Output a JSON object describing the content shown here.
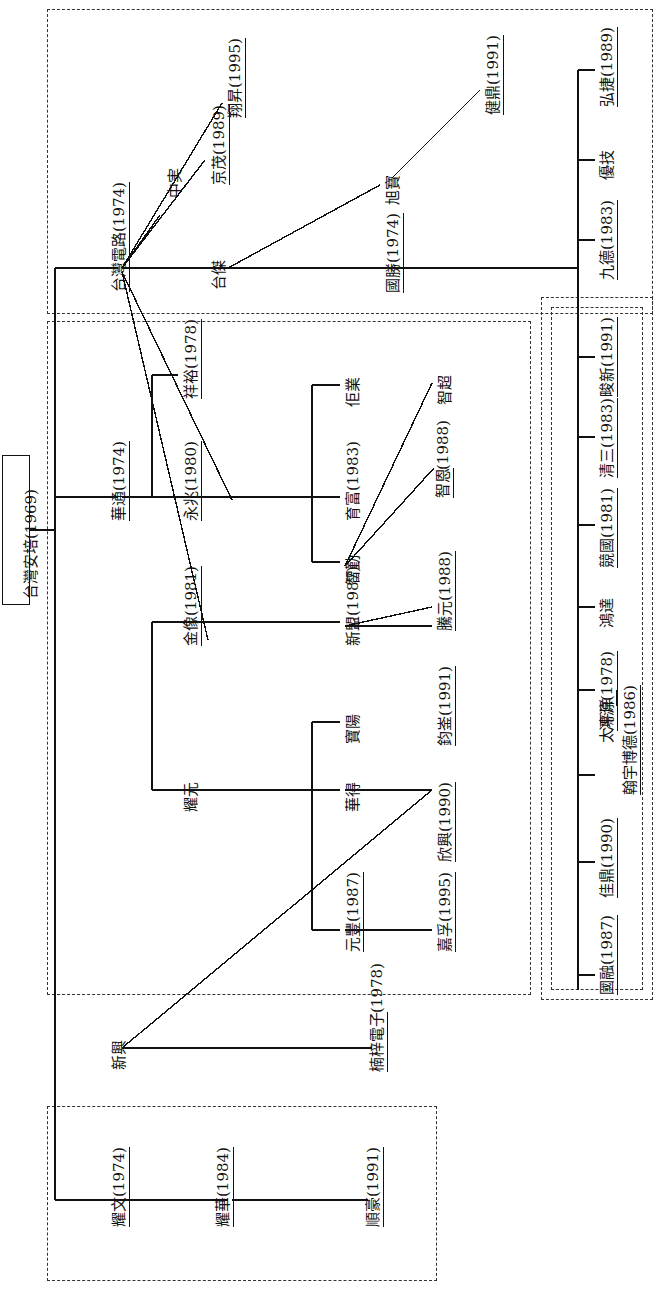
{
  "diagram": {
    "type": "organization-genealogy-tree",
    "orientation": "rotated-90-ccw",
    "root": {
      "label": "台灣安培 (1969)",
      "name": "台灣安培",
      "year": "1969"
    },
    "groups": [
      {
        "id": "group-taiwan-circuit",
        "style": "dashed"
      },
      {
        "id": "group-huatong",
        "style": "dashed"
      },
      {
        "id": "group-yaowen",
        "style": "dashed"
      },
      {
        "id": "group-right-outer",
        "style": "dashed"
      },
      {
        "id": "group-right-inner",
        "style": "dashed"
      }
    ],
    "nodes": [
      {
        "id": "n-taiwan-ampere",
        "label": "台灣安培 (1969)"
      },
      {
        "id": "n-taiwan-circuit",
        "label": "台灣電路 (1974)"
      },
      {
        "id": "n-xiangsheng",
        "label": "翔昇 (1995)"
      },
      {
        "id": "n-zhongshi",
        "label": "中実"
      },
      {
        "id": "n-jingmao",
        "label": "京茂 (1989)"
      },
      {
        "id": "n-taijie",
        "label": "台傑"
      },
      {
        "id": "n-jianding",
        "label": "健鼎 (1991)"
      },
      {
        "id": "n-xubao",
        "label": "旭寶"
      },
      {
        "id": "n-guosheng",
        "label": "國勝 (1974)"
      },
      {
        "id": "n-hongjie",
        "label": "弘捷 (1989)"
      },
      {
        "id": "n-youji",
        "label": "優技"
      },
      {
        "id": "n-jiude",
        "label": "九德 (1983)"
      },
      {
        "id": "n-junxin",
        "label": "畯新 (1991)"
      },
      {
        "id": "n-qingsan",
        "label": "清三 (1983)"
      },
      {
        "id": "n-jingguo",
        "label": "競國 (1981)"
      },
      {
        "id": "n-hongda",
        "label": "鴻達"
      },
      {
        "id": "n-hongyuan",
        "label": "鴻源 (1978)"
      },
      {
        "id": "n-taipingyang",
        "label": "太平洋"
      },
      {
        "id": "n-jiading",
        "label": "佳鼎 (1990)"
      },
      {
        "id": "n-guorong",
        "label": "國融 (1987)"
      },
      {
        "id": "n-hanyubode",
        "label": "翰宇博德 (1986)"
      },
      {
        "id": "n-huatong",
        "label": "華通 (1974)"
      },
      {
        "id": "n-xiangyu",
        "label": "祥裕 (1978)"
      },
      {
        "id": "n-yongzhao",
        "label": "永兆 (1980)"
      },
      {
        "id": "n-jinxiang",
        "label": "金像 (1981)"
      },
      {
        "id": "n-yaoyuan",
        "label": "耀元"
      },
      {
        "id": "n-quanye",
        "label": "佢業"
      },
      {
        "id": "n-yufu",
        "label": "育富 (1983)"
      },
      {
        "id": "n-zhiqin",
        "label": "智勤"
      },
      {
        "id": "n-zhichao",
        "label": "智超"
      },
      {
        "id": "n-zhien",
        "label": "智恩 (1988)"
      },
      {
        "id": "n-xinmeng",
        "label": "新盟 (1987)"
      },
      {
        "id": "n-tengyuan",
        "label": "騰元 (1988)"
      },
      {
        "id": "n-junpu",
        "label": "鈞崟 (1991)"
      },
      {
        "id": "n-baoyang",
        "label": "寶陽"
      },
      {
        "id": "n-huade",
        "label": "華得"
      },
      {
        "id": "n-xinxing1990",
        "label": "欣興 (1990)"
      },
      {
        "id": "n-yuanfeng",
        "label": "元豐 (1987)"
      },
      {
        "id": "n-jiafu",
        "label": "嘉孚 (1995)"
      },
      {
        "id": "n-xinxing",
        "label": "新興"
      },
      {
        "id": "n-nanzidianzi",
        "label": "楠梓電子 (1978)"
      },
      {
        "id": "n-yaowen",
        "label": "耀文 (1974)"
      },
      {
        "id": "n-yaohua",
        "label": "耀華 (1984)"
      },
      {
        "id": "n-shunhao",
        "label": "順豪 (1991)"
      }
    ],
    "labels": {
      "taiwan_ampere_name": "台灣安培",
      "taiwan_ampere_year": "(1969)",
      "taiwan_circuit_name": "台灣電路",
      "taiwan_circuit_year": "(1974)",
      "xiangsheng_name": "翔昇",
      "xiangsheng_year": "(1995)",
      "zhongshi_name": "中実",
      "jingmao_name": "京茂",
      "jingmao_year": "(1989)",
      "taijie_name": "台傑",
      "jianding_name": "健鼎",
      "jianding_year": "(1991)",
      "xubao_name": "旭寶",
      "guosheng_name": "國勝",
      "guosheng_year": "(1974)",
      "hongjie_name": "弘捷",
      "hongjie_year": "(1989)",
      "youji_name": "優技",
      "jiude_name": "九德",
      "jiude_year": "(1983)",
      "junxin_name": "畯新",
      "junxin_year": "(1991)",
      "qingsan_name": "清三",
      "qingsan_year": "(1983)",
      "jingguo_name": "競國",
      "jingguo_year": "(1981)",
      "hongda_name": "鴻達",
      "hongyuan_name": "鴻源",
      "hongyuan_year": "(1978)",
      "taipingyang_name": "太平洋",
      "jiading_name": "佳鼎",
      "jiading_year": "(1990)",
      "guorong_name": "國融",
      "guorong_year": "(1987)",
      "hanyubode_name": "翰宇博德",
      "hanyubode_year": "(1986)",
      "huatong_name": "華通",
      "huatong_year": "(1974)",
      "xiangyu_name": "祥裕",
      "xiangyu_year": "(1978)",
      "yongzhao_name": "永兆",
      "yongzhao_year": "(1980)",
      "jinxiang_name": "金像",
      "jinxiang_year": "(1981)",
      "yaoyuan_name": "耀元",
      "quanye_name": "佢業",
      "yufu_name": "育富",
      "yufu_year": "(1983)",
      "zhiqin_name": "智勤",
      "zhichao_name": "智超",
      "zhien_name": "智恩",
      "zhien_year": "(1988)",
      "xinmeng_name": "新盟",
      "xinmeng_year": "(1987)",
      "tengyuan_name": "騰元",
      "tengyuan_year": "(1988)",
      "junpu_name": "鈞崟",
      "junpu_year": "(1991)",
      "baoyang_name": "寶陽",
      "huade_name": "華得",
      "xinxing1990_name": "欣興",
      "xinxing1990_year": "(1990)",
      "yuanfeng_name": "元豐",
      "yuanfeng_year": "(1987)",
      "jiafu_name": "嘉孚",
      "jiafu_year": "(1995)",
      "xinxing_name": "新興",
      "nanzidianzi_name": "楠梓電子",
      "nanzidianzi_year": "(1978)",
      "yaowen_name": "耀文",
      "yaowen_year": "(1974)",
      "yaohua_name": "耀華",
      "yaohua_year": "(1984)",
      "shunhao_name": "順豪",
      "shunhao_year": "(1991)"
    },
    "colors": {
      "line": "#111111",
      "dashed_box": "#333333",
      "background": "#ffffff"
    }
  }
}
